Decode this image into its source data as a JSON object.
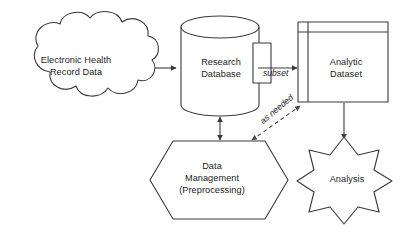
{
  "diagram": {
    "background_color": "#ffffff",
    "stroke_color": "#3a3a3a",
    "text_color": "#1d1d1d",
    "nodes": [
      {
        "id": "ehr",
        "shape": "cloud",
        "label": "Electronic Health\nRecord Data"
      },
      {
        "id": "research_database",
        "shape": "cylinder",
        "label": "Research\nDatabase"
      },
      {
        "id": "analytic_dataset",
        "shape": "table",
        "label": "Analytic\nDataset"
      },
      {
        "id": "data_management",
        "shape": "hexagon",
        "label": "Data\nManagement\n(Preprocessing)"
      },
      {
        "id": "analysis",
        "shape": "star-8",
        "label": "Analysis"
      }
    ],
    "edges": [
      {
        "id": "ehr-to-database",
        "from": "ehr",
        "to": "research_database",
        "style": "solid",
        "arrows": "end",
        "label": ""
      },
      {
        "id": "database-to-analytic",
        "from": "research_database",
        "to": "analytic_dataset",
        "style": "solid",
        "arrows": "end",
        "label": "subset"
      },
      {
        "id": "database-to-management",
        "from": "research_database",
        "to": "data_management",
        "style": "solid",
        "arrows": "both",
        "label": ""
      },
      {
        "id": "management-to-analytic",
        "from": "data_management",
        "to": "analytic_dataset",
        "style": "dashed",
        "arrows": "both",
        "label": "as needed"
      },
      {
        "id": "analytic-to-analysis",
        "from": "analytic_dataset",
        "to": "analysis",
        "style": "solid",
        "arrows": "end",
        "label": ""
      }
    ]
  }
}
